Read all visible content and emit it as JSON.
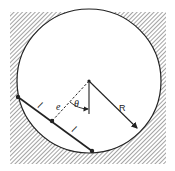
{
  "diagram": {
    "labels": {
      "radius": "R",
      "offset": "e",
      "angle": "θ",
      "half_chord_upper": "l",
      "half_chord_lower": "l"
    },
    "colors": {
      "stroke": "#222222",
      "hatch": "#555555",
      "background": "#ffffff"
    }
  }
}
